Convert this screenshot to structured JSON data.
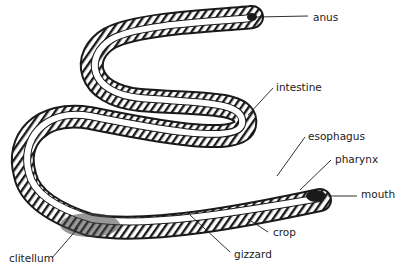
{
  "diagram": {
    "colors": {
      "ink": "#1a1a1a",
      "background": "#ffffff",
      "body_fill": "#ffffff"
    },
    "labels": [
      {
        "id": "anus",
        "text": "anus",
        "x": 313,
        "y": 12
      },
      {
        "id": "intestine",
        "text": "intestine",
        "x": 276,
        "y": 82
      },
      {
        "id": "esophagus",
        "text": "esophagus",
        "x": 308,
        "y": 131
      },
      {
        "id": "pharynx",
        "text": "pharynx",
        "x": 335,
        "y": 154
      },
      {
        "id": "mouth",
        "text": "mouth",
        "x": 361,
        "y": 189
      },
      {
        "id": "crop",
        "text": "crop",
        "x": 273,
        "y": 227
      },
      {
        "id": "gizzard",
        "text": "gizzard",
        "x": 234,
        "y": 249
      },
      {
        "id": "clitellum",
        "text": "clitellum",
        "x": 9,
        "y": 253
      }
    ]
  }
}
